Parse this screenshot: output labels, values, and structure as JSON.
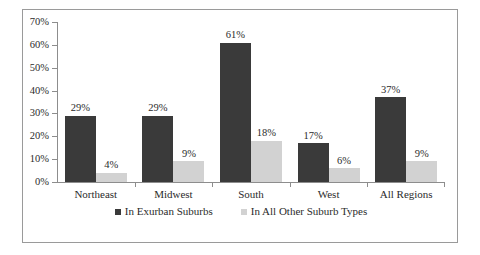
{
  "chart_data": {
    "type": "bar",
    "title": "",
    "xlabel": "",
    "ylabel": "",
    "categories": [
      "Northeast",
      "Midwest",
      "South",
      "West",
      "All Regions"
    ],
    "series": [
      {
        "name": "In Exurban Suburbs",
        "color": "#3a3a3a",
        "values": [
          29,
          29,
          61,
          17,
          37
        ],
        "labels": [
          "29%",
          "29%",
          "61%",
          "17%",
          "37%"
        ]
      },
      {
        "name": "In All Other Suburb Types",
        "color": "#d2d2d2",
        "values": [
          4,
          9,
          18,
          6,
          9
        ],
        "labels": [
          "4%",
          "9%",
          "18%",
          "6%",
          "9%"
        ]
      }
    ],
    "ylim": [
      0,
      70
    ],
    "ytick_values": [
      0,
      10,
      20,
      30,
      40,
      50,
      60,
      70
    ],
    "ytick_labels": [
      "0%",
      "10%",
      "20%",
      "30%",
      "40%",
      "50%",
      "60%",
      "70%"
    ],
    "grid": false,
    "legend_position": "bottom"
  },
  "legend": {
    "items": [
      {
        "label": "In Exurban Suburbs"
      },
      {
        "label": "In All Other Suburb Types"
      }
    ]
  }
}
